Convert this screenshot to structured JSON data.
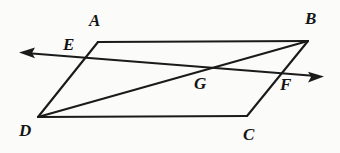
{
  "figure": {
    "kind": "geometry-diagram",
    "background_color": "#fbfbfa",
    "stroke_color": "#1a1a1a",
    "label_color": "#141414",
    "canvas": {
      "width": 340,
      "height": 153
    },
    "labels": [
      {
        "id": "A",
        "text": "A",
        "x": 89,
        "y": 12
      },
      {
        "id": "B",
        "text": "B",
        "x": 305,
        "y": 10
      },
      {
        "id": "C",
        "text": "C",
        "x": 243,
        "y": 126
      },
      {
        "id": "D",
        "text": "D",
        "x": 19,
        "y": 122
      },
      {
        "id": "E",
        "text": "E",
        "x": 63,
        "y": 36
      },
      {
        "id": "F",
        "text": "F",
        "x": 280,
        "y": 76
      },
      {
        "id": "G",
        "text": "G",
        "x": 194,
        "y": 75
      }
    ],
    "vertices": {
      "A": {
        "x": 98,
        "y": 42
      },
      "B": {
        "x": 308,
        "y": 41
      },
      "C": {
        "x": 247,
        "y": 116
      },
      "D": {
        "x": 38,
        "y": 117
      },
      "E": {
        "x": 82,
        "y": 57
      },
      "F": {
        "x": 285,
        "y": 72
      },
      "G": {
        "x": 200,
        "y": 70
      }
    },
    "segments": [
      {
        "name": "side-AB",
        "d": "M 98 42 L 308 41"
      },
      {
        "name": "side-DC",
        "d": "M 38 117 L 247 116"
      },
      {
        "name": "side-AD",
        "d": "M 98 42 L 38 117"
      },
      {
        "name": "side-BC",
        "d": "M 308 41 L 247 116"
      },
      {
        "name": "diagonal-DB",
        "d": "M 38 117 L 308 41"
      },
      {
        "name": "transversal-EF",
        "d": "M 26 53 L 316 76"
      }
    ],
    "arrows": [
      {
        "name": "arrow-left",
        "points": "19,52.4 35,47.6 32,52.9 35,58.2",
        "tip_x": 19,
        "tip_y": 52
      },
      {
        "name": "arrow-right",
        "points": "324,76.6 308,71.8 311,77.1 308,82.4",
        "tip_x": 324,
        "tip_y": 77
      }
    ]
  }
}
